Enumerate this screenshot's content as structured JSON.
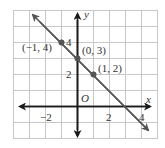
{
  "graph": {
    "origin_px": [
      77,
      106
    ],
    "unit_px": 16,
    "x_range": [
      -4,
      5
    ],
    "y_range": [
      -2,
      6
    ],
    "grid_color": "#c8c8c8",
    "axis_color": "#1a1a1a",
    "line_color": "#555555",
    "point_color": "#555555",
    "axis_labels": {
      "x": "x",
      "y": "y",
      "origin": "O"
    },
    "tick_labels": {
      "x_neg2": "−2",
      "x_2": "2",
      "x_4": "4",
      "y_2": "2",
      "y_4": "4"
    },
    "points": [
      {
        "label": "(−1, 4)",
        "x": -1,
        "y": 4
      },
      {
        "label": "(0, 3)",
        "x": 0,
        "y": 3
      },
      {
        "label": "(1, 2)",
        "x": 1,
        "y": 2
      }
    ],
    "line": {
      "equation": "y = -x + 3",
      "slope": -1,
      "intercept": 3
    }
  }
}
